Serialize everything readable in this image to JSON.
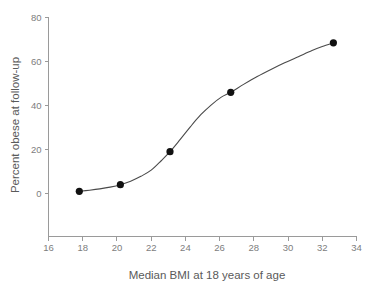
{
  "chart_data": {
    "type": "scatter",
    "title": "",
    "xlabel": "Median BMI at 18 years of age",
    "ylabel": "Percent obese at follow-up",
    "xlim": [
      16,
      34
    ],
    "ylim": [
      0,
      80
    ],
    "xticks": [
      16,
      18,
      20,
      22,
      24,
      26,
      28,
      30,
      32,
      34
    ],
    "yticks": [
      0,
      20,
      40,
      60,
      80
    ],
    "grid": false,
    "legend": "none",
    "series": [
      {
        "name": "Percent obese at follow-up",
        "marker": "filled-circle",
        "marker_color": "#111111",
        "x": [
          17.8,
          20.2,
          23.1,
          26.65,
          32.65
        ],
        "y": [
          1,
          4,
          19,
          46,
          68.5
        ]
      }
    ],
    "fit_curve": {
      "name": "smoothed trend line",
      "style": "solid",
      "color": "#4a4a4a",
      "x": [
        17.8,
        18.4,
        19.0,
        19.6,
        20.2,
        20.8,
        21.4,
        22.0,
        22.6,
        23.1,
        23.7,
        24.3,
        24.9,
        25.5,
        26.1,
        26.65,
        27.4,
        28.2,
        29.0,
        29.8,
        30.6,
        31.4,
        32.0,
        32.65
      ],
      "y": [
        1.0,
        1.5,
        2.1,
        2.9,
        4.0,
        5.6,
        7.8,
        10.6,
        15.0,
        19.0,
        24.6,
        30.4,
        35.8,
        40.2,
        43.8,
        46.0,
        49.6,
        53.2,
        56.4,
        59.4,
        62.2,
        65.0,
        66.8,
        68.5
      ]
    }
  },
  "axis_tick_labels": {
    "x": [
      "16",
      "18",
      "20",
      "22",
      "24",
      "26",
      "28",
      "30",
      "32",
      "34"
    ],
    "y": [
      "0",
      "20",
      "40",
      "60",
      "80"
    ]
  },
  "colors": {
    "axis": "#9a9a9a",
    "tick_text": "#7d7d7d",
    "axis_title": "#5a5a5a",
    "marker": "#111111",
    "curve": "#4a4a4a",
    "background": "#ffffff"
  }
}
